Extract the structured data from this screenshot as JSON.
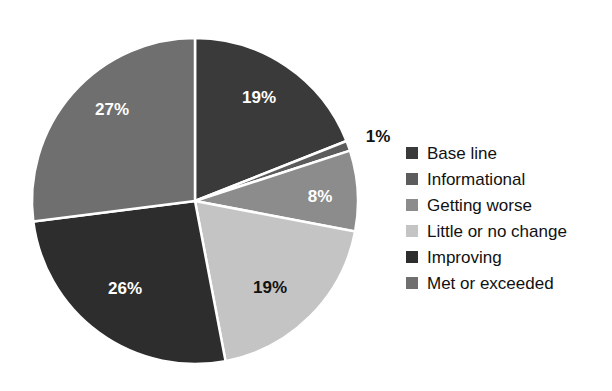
{
  "chart_data": {
    "type": "pie",
    "title": "",
    "subtitle": "",
    "xlabel": "",
    "ylabel": "",
    "grid": false,
    "legend_position": "right",
    "start_angle_deg": 0,
    "direction": "clockwise",
    "separator_color": "#ffffff",
    "background_color": "#ffffff",
    "categories": [
      "Base line",
      "Informational",
      "Getting worse",
      "Little or no change",
      "Improving",
      "Met or exceeded"
    ],
    "values": [
      19,
      1,
      8,
      19,
      26,
      27
    ],
    "labels": [
      "19%",
      "1%",
      "8%",
      "19%",
      "26%",
      "27%"
    ],
    "colors": [
      "#3a3a3a",
      "#5c5c5c",
      "#8c8c8c",
      "#c4c4c4",
      "#2d2d2d",
      "#6f6f6f"
    ],
    "label_text_colors": [
      "#ffffff",
      "#111111",
      "#ffffff",
      "#111111",
      "#ffffff",
      "#ffffff"
    ],
    "slices": [
      {
        "name": "Base line",
        "value": 19,
        "label": "19%",
        "color": "#3a3a3a",
        "label_color": "light",
        "label_x": 259,
        "label_y": 97
      },
      {
        "name": "Informational",
        "value": 1,
        "label": "1%",
        "color": "#5c5c5c",
        "label_color": "dark",
        "label_x": 378,
        "label_y": 136
      },
      {
        "name": "Getting worse",
        "value": 8,
        "label": "8%",
        "color": "#8c8c8c",
        "label_color": "light",
        "label_x": 320,
        "label_y": 196
      },
      {
        "name": "Little or no change",
        "value": 19,
        "label": "19%",
        "color": "#c4c4c4",
        "label_color": "dark",
        "label_x": 270,
        "label_y": 287
      },
      {
        "name": "Improving",
        "value": 26,
        "label": "26%",
        "color": "#2d2d2d",
        "label_color": "light",
        "label_x": 125,
        "label_y": 288
      },
      {
        "name": "Met or exceeded",
        "value": 27,
        "label": "27%",
        "color": "#6f6f6f",
        "label_color": "light",
        "label_x": 112,
        "label_y": 109
      }
    ]
  },
  "legend": {
    "items": [
      {
        "label": "Base line",
        "color": "#3a3a3a"
      },
      {
        "label": "Informational",
        "color": "#5c5c5c"
      },
      {
        "label": "Getting worse",
        "color": "#8c8c8c"
      },
      {
        "label": "Little or no change",
        "color": "#c4c4c4"
      },
      {
        "label": "Improving",
        "color": "#2d2d2d"
      },
      {
        "label": "Met or exceeded",
        "color": "#6f6f6f"
      }
    ]
  },
  "geometry": {
    "center_x": 195,
    "center_y": 201,
    "radius": 163
  }
}
